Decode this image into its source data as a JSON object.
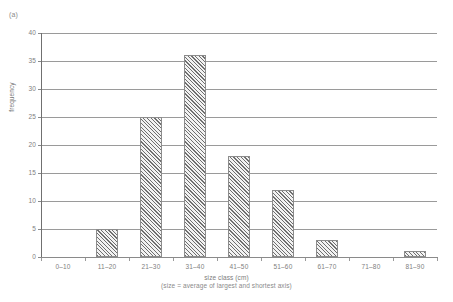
{
  "figure": {
    "panel_label": "(a)",
    "background_color": "#ffffff",
    "axis_color": "#8a8a8a",
    "grid_color": "#9a9a9a",
    "bar_edge_color": "#8c8c8c",
    "bar_hatch_color": "#6f6f6f",
    "text_color": "#808080"
  },
  "chart_data": {
    "type": "bar",
    "title": "",
    "subtitle": "",
    "xlabel": "size class (cm)",
    "xlabel_note": "(size = average of largest and shortest axis)",
    "ylabel": "frequency",
    "categories": [
      "0–10",
      "11–20",
      "21–30",
      "31–40",
      "41–50",
      "51–60",
      "61–70",
      "71–80",
      "81–90"
    ],
    "values": [
      0,
      5,
      25,
      36,
      18,
      12,
      3,
      0,
      1
    ],
    "ylim": [
      0,
      40
    ],
    "ytick_labels": [
      "40",
      "35",
      "30",
      "25",
      "20",
      "15",
      "10",
      "5",
      "0"
    ],
    "ytick_values": [
      40,
      35,
      30,
      25,
      20,
      15,
      10,
      5,
      0
    ],
    "ytick_step": 5,
    "grid": "horizontal",
    "legend": "none",
    "bar_fill": "diagonal-hatch"
  }
}
